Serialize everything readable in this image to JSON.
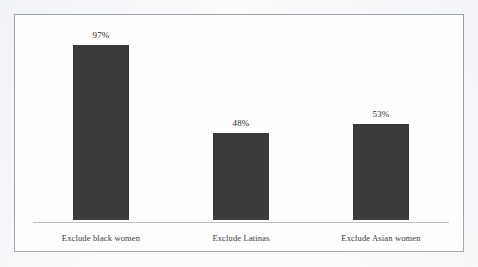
{
  "chart_data": {
    "type": "bar",
    "title": "",
    "subtitle": "",
    "xlabel": "",
    "ylabel": "",
    "categories": [
      "Exclude black women",
      "Exclude Latinas",
      "Exclude Asian women"
    ],
    "values": [
      97,
      48,
      53
    ],
    "value_labels": [
      "97%",
      "48%",
      "53%"
    ],
    "ylim": [
      0,
      100
    ],
    "grid": false,
    "legend": false,
    "legend_position": "none",
    "axis_line_visible": true,
    "y_axis_visible": false,
    "y_tick_labels": [],
    "bar_color": "#3a3a3a",
    "frame_border_color": "#9a9ea6",
    "background_color": "#fefefe",
    "label_text_color": "#1f1f1f",
    "value_text_color": "#2b2b2b"
  }
}
